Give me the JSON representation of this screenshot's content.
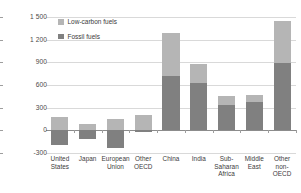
{
  "chart_data": {
    "type": "bar",
    "title": "",
    "xlabel": "",
    "ylabel": "Mtoe",
    "ylim": [
      -300,
      1500
    ],
    "ytick_labels": [
      "1 500",
      "1 200",
      "900",
      "600",
      "300",
      "0",
      "-300"
    ],
    "ytick_values": [
      1500,
      1200,
      900,
      600,
      300,
      0,
      -300
    ],
    "grid": true,
    "stacked": true,
    "legend_position": "top-left-inside",
    "categories": [
      "United States",
      "Japan",
      "European Union",
      "Other OECD",
      "China",
      "India",
      "Sub-Saharan Africa",
      "Middle East",
      "Other non-OECD"
    ],
    "category_lines": [
      [
        "United",
        "States"
      ],
      [
        "Japan"
      ],
      [
        "European",
        "Union"
      ],
      [
        "Other",
        "OECD"
      ],
      [
        "China"
      ],
      [
        "India"
      ],
      [
        "Sub-",
        "Saharan",
        "Africa"
      ],
      [
        "Middle",
        "East"
      ],
      [
        "Other",
        "non-OECD"
      ]
    ],
    "series": [
      {
        "name": "Low-carbon fuels",
        "color": "#b5b5b5",
        "values": [
          180,
          90,
          150,
          200,
          570,
          260,
          120,
          100,
          560
        ]
      },
      {
        "name": "Fossil fuels",
        "color": "#808080",
        "values": [
          -190,
          -110,
          -240,
          -25,
          720,
          620,
          330,
          370,
          890
        ]
      }
    ]
  },
  "legend": {
    "items": [
      {
        "label": "Low-carbon fuels",
        "color": "#b5b5b5"
      },
      {
        "label": "Fossil fuels",
        "color": "#808080"
      }
    ]
  },
  "colors": {
    "low_carbon": "#b5b5b5",
    "fossil": "#808080",
    "gridline": "#d9d9d9",
    "zero_line": "#8c8c8c",
    "text": "#3b3b3b",
    "background": "#ffffff"
  }
}
